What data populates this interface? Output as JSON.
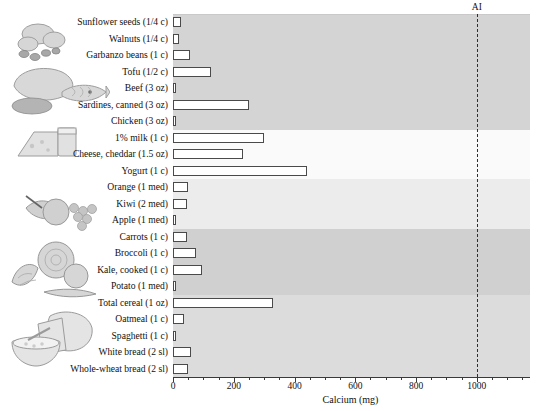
{
  "chart_data": {
    "type": "bar",
    "orientation": "horizontal",
    "title": "",
    "xlabel": "Calcium (mg)",
    "ylabel": "",
    "xlim": [
      0,
      1175
    ],
    "xticks": [
      0,
      200,
      400,
      600,
      800,
      1000
    ],
    "xtick_labels": [
      "0",
      "200",
      "400",
      "600",
      "800",
      "1000"
    ],
    "minor_tick_step": 50,
    "grid": false,
    "legend": "none",
    "annotations": [
      {
        "name": "AI",
        "label": "AI",
        "value": 1000,
        "style": "dashed-vertical-line"
      }
    ],
    "categories": [
      "Sunflower seeds (1/4 c)",
      "Walnuts (1/4 c)",
      "Garbanzo beans (1 c)",
      "Tofu (1/2 c)",
      "Beef (3 oz)",
      "Sardines, canned (3 oz)",
      "Chicken (3 oz)",
      "1% milk (1 c)",
      "Cheese, cheddar (1.5 oz)",
      "Yogurt (1 c)",
      "Orange (1 med)",
      "Kiwi (2 med)",
      "Apple (1 med)",
      "Carrots (1 c)",
      "Broccoli (1 c)",
      "Kale, cooked (1 c)",
      "Potato (1 med)",
      "Total cereal (1 oz)",
      "Oatmeal (1 c)",
      "Spaghetti (1 c)",
      "White bread (2 sl)",
      "Whole-wheat bread (2 sl)"
    ],
    "values": [
      25,
      20,
      55,
      125,
      8,
      250,
      10,
      300,
      230,
      440,
      50,
      45,
      8,
      45,
      75,
      95,
      10,
      330,
      35,
      10,
      60,
      50
    ],
    "groups": [
      {
        "name": "nuts-legumes-protein",
        "from": 0,
        "to": 6,
        "shade": "#d4d4d4"
      },
      {
        "name": "dairy",
        "from": 7,
        "to": 9,
        "shade": "#fafafa"
      },
      {
        "name": "fruits",
        "from": 10,
        "to": 12,
        "shade": "#ececec"
      },
      {
        "name": "vegetables",
        "from": 13,
        "to": 16,
        "shade": "#d0d0d0"
      },
      {
        "name": "grains",
        "from": 17,
        "to": 21,
        "shade": "#dcdcdc"
      }
    ]
  },
  "axis": {
    "x_title": "Calcium (mg)"
  },
  "illustrations": [
    {
      "name": "nuts-illustration",
      "label": "nuts and seeds"
    },
    {
      "name": "meat-fish-illustration",
      "label": "poultry and fish"
    },
    {
      "name": "dairy-illustration",
      "label": "cheese and milk"
    },
    {
      "name": "fruit-illustration",
      "label": "fruit basket"
    },
    {
      "name": "vegetable-illustration",
      "label": "vegetables"
    },
    {
      "name": "grains-illustration",
      "label": "bread and cereal"
    }
  ]
}
